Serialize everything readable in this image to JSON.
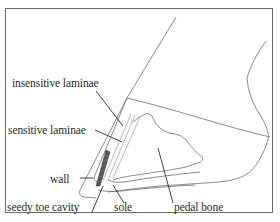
{
  "figure": {
    "labels": {
      "insensitive_laminae": "insensitive laminae",
      "sensitive_laminae": "sensitive laminae",
      "wall": "wall",
      "seedy_toe_cavity": "seedy toe cavity",
      "sole": "sole",
      "pedal_bone": "pedal bone"
    },
    "colors": {
      "outline": "#6e6e6e",
      "leader": "#2a2a2a",
      "frame": "#6a6a6a",
      "background": "#ffffff"
    }
  }
}
